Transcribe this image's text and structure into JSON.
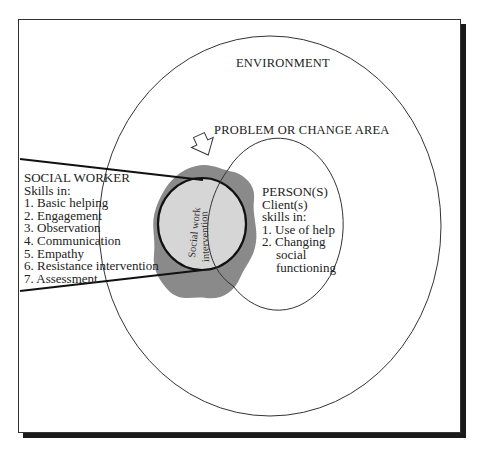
{
  "diagram": {
    "environment_label": "ENVIRONMENT",
    "problem_label": "PROBLEM OR CHANGE AREA",
    "intervention_label_1": "Social work",
    "intervention_label_2": "intervention",
    "social_worker": {
      "title": "SOCIAL WORKER",
      "subtitle": "Skills in:",
      "skills": [
        "1. Basic helping",
        "2. Engagement",
        "3. Observation",
        "4. Communication",
        "5. Empathy",
        "6. Resistance intervention",
        "7. Assessment"
      ]
    },
    "person": {
      "title": "PERSON(S)",
      "line2": "Client(s)",
      "line3": "skills in:",
      "items": [
        "1. Use of help",
        "2. Changing",
        "social",
        "functioning"
      ]
    },
    "colors": {
      "blob": "#8a8a8a",
      "inner_circle": "#d6d6d6",
      "line": "#222222",
      "shadow": "#1a1a1a"
    }
  }
}
